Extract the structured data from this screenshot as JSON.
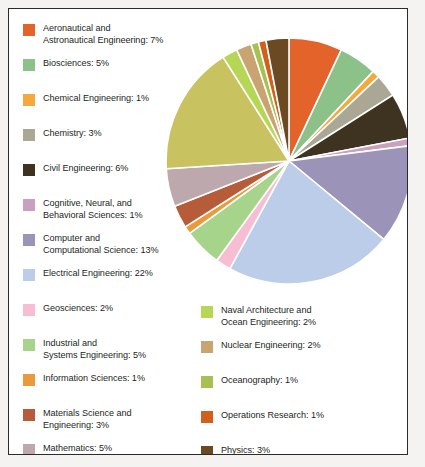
{
  "chart_data": {
    "type": "pie",
    "title": "",
    "subtitle": "",
    "xlabel": "",
    "ylabel": "",
    "grid": false,
    "legend_position": "left-and-bottom-right",
    "total_percent": 100,
    "start_angle_deg": 0,
    "direction": "clockwise",
    "categories": [
      "Aeronautical and Astronautical Engineering",
      "Biosciences",
      "Chemical Engineering",
      "Chemistry",
      "Civil Engineering",
      "Cognitive, Neural, and Behavioral Sciences",
      "Computer and Computational Science",
      "Electrical Engineering",
      "Geosciences",
      "Industrial and Systems Engineering",
      "Information Sciences",
      "Materials Science and Engineering",
      "Mathematics",
      "Mechanical Engineering",
      "Naval Architecture and Ocean Engineering",
      "Nuclear Engineering",
      "Oceanography",
      "Operations Research",
      "Physics"
    ],
    "values": [
      7,
      5,
      1,
      3,
      6,
      1,
      13,
      22,
      2,
      5,
      1,
      3,
      5,
      17,
      2,
      2,
      1,
      1,
      3
    ],
    "colors": [
      "#e4632a",
      "#8cc28a",
      "#f5a83c",
      "#aba795",
      "#3d3320",
      "#c9a0bd",
      "#9b93b8",
      "#bbcde9",
      "#f7bdd3",
      "#a5d48a",
      "#ea9a3c",
      "#b65c38",
      "#bda8ae",
      "#c9c261",
      "#b5d755",
      "#c9a470",
      "#a8c051",
      "#d2601c",
      "#6b4a23"
    ],
    "slices": [
      {
        "label": "Aeronautical and Astronautical Engineering",
        "value": 7,
        "color": "#e4632a"
      },
      {
        "label": "Biosciences",
        "value": 5,
        "color": "#8cc28a"
      },
      {
        "label": "Chemical Engineering",
        "value": 1,
        "color": "#f5a83c"
      },
      {
        "label": "Chemistry",
        "value": 3,
        "color": "#aba795"
      },
      {
        "label": "Civil Engineering",
        "value": 6,
        "color": "#3d3320"
      },
      {
        "label": "Cognitive, Neural, and Behavioral Sciences",
        "value": 1,
        "color": "#c9a0bd"
      },
      {
        "label": "Computer and Computational Science",
        "value": 13,
        "color": "#9b93b8"
      },
      {
        "label": "Electrical Engineering",
        "value": 22,
        "color": "#bbcde9"
      },
      {
        "label": "Geosciences",
        "value": 2,
        "color": "#f7bdd3"
      },
      {
        "label": "Industrial and Systems Engineering",
        "value": 5,
        "color": "#a5d48a"
      },
      {
        "label": "Information Sciences",
        "value": 1,
        "color": "#ea9a3c"
      },
      {
        "label": "Materials Science and Engineering",
        "value": 3,
        "color": "#b65c38"
      },
      {
        "label": "Mathematics",
        "value": 5,
        "color": "#bda8ae"
      },
      {
        "label": "Mechanical Engineering",
        "value": 17,
        "color": "#c9c261"
      },
      {
        "label": "Naval Architecture and Ocean Engineering",
        "value": 2,
        "color": "#b5d755"
      },
      {
        "label": "Nuclear Engineering",
        "value": 2,
        "color": "#c9a470"
      },
      {
        "label": "Oceanography",
        "value": 1,
        "color": "#a8c051"
      },
      {
        "label": "Operations Research",
        "value": 1,
        "color": "#d2601c"
      },
      {
        "label": "Physics",
        "value": 3,
        "color": "#6b4a23"
      }
    ]
  },
  "legend": {
    "left_column": [
      {
        "color": "#e4632a",
        "lines": [
          "Aeronautical and",
          "Astronautical Engineering: 7%"
        ]
      },
      {
        "color": "#8cc28a",
        "lines": [
          "Biosciences: 5%"
        ]
      },
      {
        "color": "#f5a83c",
        "lines": [
          "Chemical Engineering: 1%"
        ]
      },
      {
        "color": "#aba795",
        "lines": [
          "Chemistry: 3%"
        ]
      },
      {
        "color": "#3d3320",
        "lines": [
          "Civil Engineering: 6%"
        ]
      },
      {
        "color": "#c9a0bd",
        "lines": [
          "Cognitive, Neural, and",
          "Behavioral Sciences: 1%"
        ]
      },
      {
        "color": "#9b93b8",
        "lines": [
          "Computer and",
          "Computational Science: 13%"
        ]
      },
      {
        "color": "#bbcde9",
        "lines": [
          "Electrical Engineering: 22%"
        ]
      },
      {
        "color": "#f7bdd3",
        "lines": [
          "Geosciences: 2%"
        ]
      },
      {
        "color": "#a5d48a",
        "lines": [
          "Industrial and",
          "Systems Engineering: 5%"
        ]
      },
      {
        "color": "#ea9a3c",
        "lines": [
          "Information Sciences: 1%"
        ]
      },
      {
        "color": "#b65c38",
        "lines": [
          "Materials Science and",
          "Engineering: 3%"
        ]
      },
      {
        "color": "#bda8ae",
        "lines": [
          "Mathematics: 5%"
        ]
      },
      {
        "color": "#c9c261",
        "lines": [
          "Mechanical Engineering: 17%"
        ]
      }
    ],
    "right_column": [
      {
        "color": "#b5d755",
        "lines": [
          "Naval Architecture and",
          "Ocean Engineering: 2%"
        ]
      },
      {
        "color": "#c9a470",
        "lines": [
          "Nuclear Engineering: 2%"
        ]
      },
      {
        "color": "#a8c051",
        "lines": [
          "Oceanography: 1%"
        ]
      },
      {
        "color": "#d2601c",
        "lines": [
          "Operations Research: 1%"
        ]
      },
      {
        "color": "#6b4a23",
        "lines": [
          "Physics: 3%"
        ]
      }
    ]
  }
}
